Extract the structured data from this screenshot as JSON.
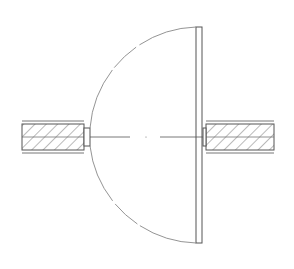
{
  "drawing": {
    "type": "door-swing-plan-symbol",
    "background": "#ffffff",
    "line_color": "#555555",
    "light_line_color": "#888888",
    "hatch_color": "#666666"
  }
}
